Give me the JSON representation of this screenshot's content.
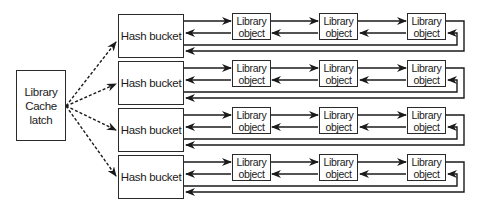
{
  "diagram": {
    "type": "library-cache-structure",
    "latch": {
      "label": "Library\nCache\nlatch"
    },
    "buckets": [
      {
        "label": "Hash bucket",
        "objects": [
          "Library\nobject",
          "Library\nobject",
          "Library\nobject"
        ]
      },
      {
        "label": "Hash bucket",
        "objects": [
          "Library\nobject",
          "Library\nobject",
          "Library\nobject"
        ]
      },
      {
        "label": "Hash bucket",
        "objects": [
          "Library\nobject",
          "Library\nobject",
          "Library\nobject"
        ]
      },
      {
        "label": "Hash bucket",
        "objects": [
          "Library\nobject",
          "Library\nobject",
          "Library\nobject"
        ]
      }
    ],
    "edges": {
      "latch_to_buckets": "dashed arrows",
      "bucket_chain": "doubly linked list with wrap-around return link"
    },
    "colors": {
      "line": "#2a2a2a",
      "background": "#ffffff"
    }
  }
}
